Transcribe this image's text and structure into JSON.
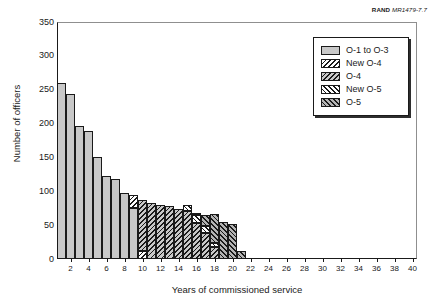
{
  "source_note": {
    "publisher": "RAND",
    "document_id": "MR1479-7.7"
  },
  "chart_data": {
    "type": "bar",
    "subtype": "stacked-histogram",
    "title": "",
    "xlabel": "Years of commissioned service",
    "ylabel": "Number of officers",
    "xlim": [
      0,
      40
    ],
    "ylim": [
      0,
      350
    ],
    "ytick_labels": [
      "0",
      "50",
      "100",
      "150",
      "200",
      "250",
      "300",
      "350"
    ],
    "ytick_values": [
      0,
      50,
      100,
      150,
      200,
      250,
      300,
      350
    ],
    "xtick_labels": [
      "2",
      "4",
      "6",
      "8",
      "10",
      "12",
      "14",
      "16",
      "18",
      "20",
      "22",
      "24",
      "26",
      "28",
      "30",
      "32",
      "34",
      "36",
      "38",
      "40"
    ],
    "xtick_values": [
      2,
      4,
      6,
      8,
      10,
      12,
      14,
      16,
      18,
      20,
      22,
      24,
      26,
      28,
      30,
      32,
      34,
      36,
      38,
      40
    ],
    "grid": false,
    "legend_position": "top-right",
    "categories": [
      1,
      2,
      3,
      4,
      5,
      6,
      7,
      8,
      9,
      10,
      11,
      12,
      13,
      14,
      15,
      16,
      17,
      18,
      19,
      20,
      21
    ],
    "series": [
      {
        "name": "O-1 to O-3",
        "pattern": "solid-gray",
        "fill": "#c8c8c8",
        "values": [
          260,
          243,
          197,
          189,
          151,
          123,
          118,
          98,
          75,
          0,
          0,
          0,
          0,
          0,
          0,
          0,
          0,
          0,
          0,
          0,
          0
        ]
      },
      {
        "name": "New O-4",
        "pattern": "backslash-hatch-light",
        "fill": "#ffffff",
        "values": [
          0,
          0,
          0,
          0,
          0,
          0,
          0,
          0,
          20,
          12,
          0,
          0,
          0,
          0,
          0,
          0,
          0,
          0,
          0,
          0,
          0
        ]
      },
      {
        "name": "O-4",
        "pattern": "backslash-hatch-gray",
        "fill": "#c8c8c8",
        "values": [
          0,
          0,
          0,
          0,
          0,
          0,
          0,
          0,
          0,
          75,
          83,
          80,
          78,
          74,
          71,
          53,
          39,
          18,
          0,
          0,
          0
        ]
      },
      {
        "name": "New O-5",
        "pattern": "forwardslash-hatch-light",
        "fill": "#ffffff",
        "values": [
          0,
          0,
          0,
          0,
          0,
          0,
          0,
          0,
          0,
          0,
          0,
          0,
          0,
          0,
          9,
          12,
          10,
          5,
          0,
          0,
          0
        ]
      },
      {
        "name": "O-5",
        "pattern": "forwardslash-hatch-gray",
        "fill": "#b4b4b4",
        "values": [
          0,
          0,
          0,
          0,
          0,
          0,
          0,
          0,
          0,
          0,
          0,
          0,
          0,
          0,
          0,
          2,
          16,
          43,
          55,
          52,
          12
        ]
      }
    ],
    "totals": [
      260,
      243,
      197,
      189,
      151,
      123,
      118,
      98,
      95,
      87,
      83,
      80,
      78,
      74,
      80,
      67,
      65,
      66,
      55,
      52,
      12
    ]
  },
  "legend": {
    "items": [
      {
        "label": "O-1 to O-3",
        "pattern": "solid-gray"
      },
      {
        "label": "New O-4",
        "pattern": "backslash-hatch-light"
      },
      {
        "label": "O-4",
        "pattern": "backslash-hatch-gray"
      },
      {
        "label": "New O-5",
        "pattern": "forwardslash-hatch-light"
      },
      {
        "label": "O-5",
        "pattern": "forwardslash-hatch-gray"
      }
    ]
  },
  "colors": {
    "axis": "#1a1a1a",
    "gray_fill": "#c8c8c8",
    "dark_gray_fill": "#b4b4b4",
    "white_fill": "#ffffff"
  }
}
